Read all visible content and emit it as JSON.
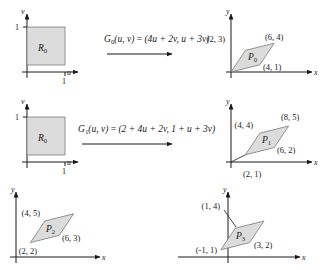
{
  "figure": {
    "fill_color": "#dcdcdc",
    "stroke_color": "#7a7a7a",
    "axis_color": "#1a1a1a"
  },
  "panels": [
    {
      "id": "domain-0",
      "kind": "domain",
      "axis_x_label": "u",
      "axis_y_label": "v",
      "tick_x_label": "1",
      "tick_y_label": "1",
      "region_label": "R",
      "region_sub": "0",
      "shape_points": "0,1 1,1 1,0 0,0"
    },
    {
      "id": "image-0",
      "kind": "image",
      "axis_x_label": "x",
      "axis_y_label": "y",
      "region_label": "P",
      "region_sub": "0",
      "shape_points": "0,0 2,3 6,4 4,1",
      "vertices": [
        {
          "label": "(2, 3)",
          "point": [
            2,
            3
          ]
        },
        {
          "label": "(6, 4)",
          "point": [
            6,
            4
          ]
        },
        {
          "label": "(4, 1)",
          "point": [
            4,
            1
          ]
        }
      ]
    },
    {
      "id": "domain-1",
      "kind": "domain",
      "axis_x_label": "u",
      "axis_y_label": "v",
      "tick_x_label": "1",
      "tick_y_label": "1",
      "region_label": "R",
      "region_sub": "0",
      "shape_points": "0,1 1,1 1,0 0,0"
    },
    {
      "id": "image-1",
      "kind": "image",
      "axis_x_label": "x",
      "axis_y_label": "y",
      "region_label": "P",
      "region_sub": "1",
      "shape_points": "2,1 4,4 8,5 6,2",
      "vertices": [
        {
          "label": "(4, 4)",
          "point": [
            4,
            4
          ]
        },
        {
          "label": "(8, 5)",
          "point": [
            8,
            5
          ]
        },
        {
          "label": "(6, 2)",
          "point": [
            6,
            2
          ]
        },
        {
          "label": "(2, 1)",
          "point": [
            2,
            1
          ]
        }
      ]
    },
    {
      "id": "image-2",
      "kind": "image",
      "axis_x_label": "x",
      "axis_y_label": "y",
      "region_label": "P",
      "region_sub": "2",
      "shape_points": "2,2 4,5 6,3",
      "vertices": [
        {
          "label": "(4, 5)",
          "point": [
            4,
            5
          ]
        },
        {
          "label": "(6, 3)",
          "point": [
            6,
            3
          ]
        },
        {
          "label": "(2, 2)",
          "point": [
            2,
            2
          ]
        }
      ]
    },
    {
      "id": "image-3",
      "kind": "image",
      "axis_x_label": "x",
      "axis_y_label": "y",
      "region_label": "P",
      "region_sub": "3",
      "shape_points": "-1,1 1,4 3,2",
      "vertices": [
        {
          "label": "(1, 4)",
          "point": [
            1,
            4
          ]
        },
        {
          "label": "(3, 2)",
          "point": [
            3,
            2
          ]
        },
        {
          "label": "(-1, 1)",
          "point": [
            -1,
            1
          ]
        }
      ]
    }
  ],
  "transformations": [
    {
      "id": "G0",
      "name": "G",
      "sub": "0",
      "args": "(u, v)",
      "equals": " = ",
      "expression": "(4u + 2v, u + 3v)",
      "full_text": "G0(u, v) = (4u + 2v, u + 3v)"
    },
    {
      "id": "G1",
      "name": "G",
      "sub": "1",
      "args": "(u, v)",
      "equals": " = ",
      "expression": "(2 + 4u + 2v, 1 + u + 3v)",
      "full_text": "G1(u, v) = (2 + 4u + 2v, 1 + u + 3v)"
    }
  ]
}
